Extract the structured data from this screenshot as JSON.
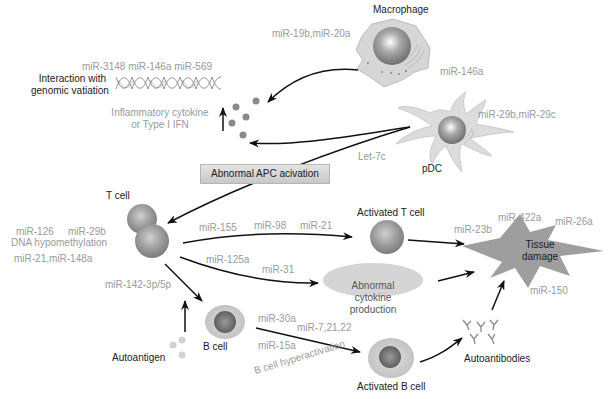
{
  "diagram": {
    "cells": {
      "macrophage": "Macrophage",
      "pdc": "pDC",
      "t_cell": "T cell",
      "activated_t_cell": "Activated T cell",
      "b_cell": "B cell",
      "activated_b_cell": "Activated B cell"
    },
    "processes": {
      "genomic_line1": "Interaction with",
      "genomic_line2": "genomic vatiation",
      "cytokine_line1": "Inflammatory cytokine",
      "cytokine_line2": "or Type I IFN",
      "apc_box": "Abnormal APC acivation",
      "abnormal_cytokine_line1": "Abnormal",
      "abnormal_cytokine_line2": "cytokine",
      "abnormal_cytokine_line3": "production",
      "tissue_line1": "Tissue",
      "tissue_line2": "damage",
      "autoantigen": "Autoantigen",
      "autoantibodies": "Autoantibodies",
      "b_cell_hyper": "B cell hyperactivation",
      "dna_hypo": "DNA hypomethylation"
    },
    "mirnas": {
      "genomic": "miR-3148 miR-146a miR-569",
      "macrophage_in": "miR-19b,miR-20a",
      "macrophage_out": "miR-146a",
      "pdc": "miR-29b,miR-29c",
      "let7c": "Let-7c",
      "tcell_a": "miR-126",
      "tcell_b": "miR-29b",
      "tcell_c": "miR-21,miR-148a",
      "t_155": "miR-155",
      "t_98": "miR-98",
      "t_21": "miR-21",
      "t_125a": "miR-125a",
      "t_31": "miR-31",
      "t_142": "miR-142-3p/5p",
      "b_30a": "miR-30a",
      "b_7": "miR-7,21,22",
      "b_15a": "miR-15a",
      "tissue_23b": "miR-23b",
      "tissue_422a": "miR-422a",
      "tissue_26a": "miR-26a",
      "tissue_150": "miR-150"
    },
    "colors": {
      "text_dark": "#1a1a1a",
      "text_grey": "#9a9a9a",
      "cell_fill": "#d9d9d9",
      "nucleus": "#8c8c8c",
      "tissue_fill": "#9e9e9e",
      "arrow": "#111111"
    }
  }
}
